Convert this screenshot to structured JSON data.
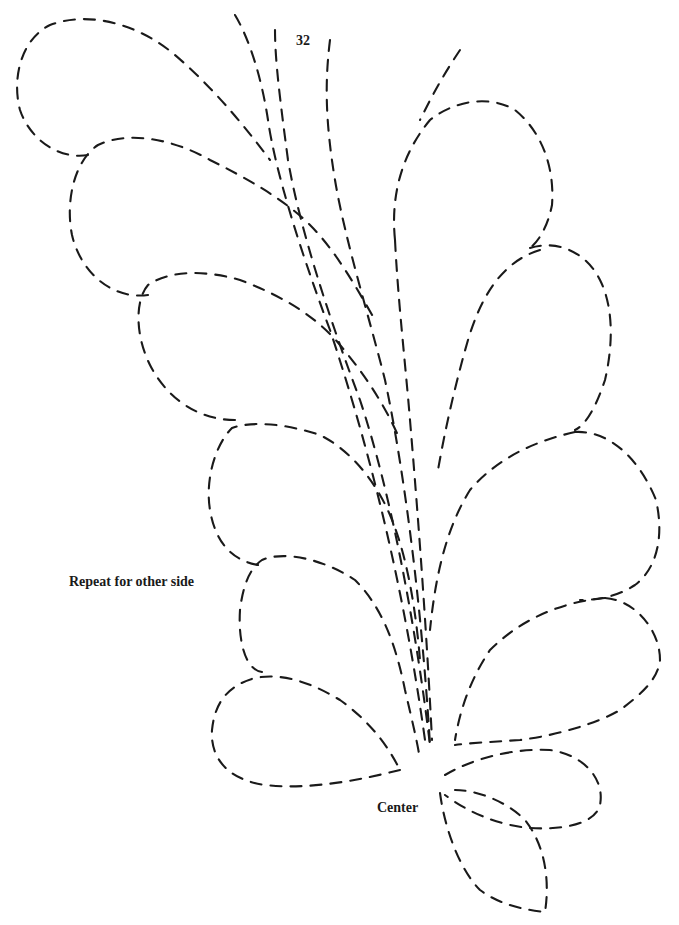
{
  "page": {
    "number": "32"
  },
  "labels": {
    "repeat": "Repeat for other side",
    "center": "Center"
  },
  "pattern": {
    "type": "quilting-feather-stencil",
    "line_style": "dashed",
    "stroke_color": "#1a1a1a",
    "background_color": "#ffffff",
    "left_plumes": 5,
    "right_plumes": 4,
    "center_plumes": 2,
    "spine_lines": 5
  }
}
